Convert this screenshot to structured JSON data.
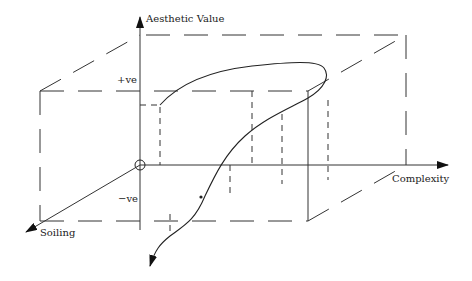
{
  "diagram": {
    "type": "3d-box-curve",
    "axes": {
      "vertical_label": "Aesthetic Value",
      "horizontal_label": "Complexity",
      "depth_label": "Soiling"
    },
    "markers": {
      "positive": "+ve",
      "negative": "−ve"
    },
    "colors": {
      "line": "#333333",
      "background": "#ffffff"
    }
  }
}
